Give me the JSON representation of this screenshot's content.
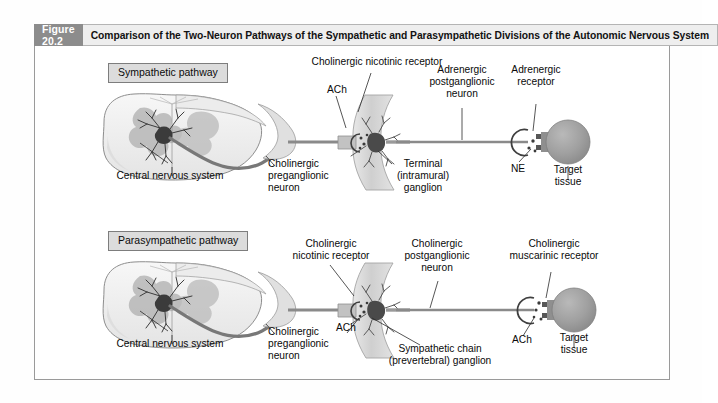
{
  "figure": {
    "number": "Figure 20.2",
    "title": "Comparison of the Two-Neuron Pathways of the Sympathetic and Parasympathetic Divisions of the Autonomic Nervous System"
  },
  "colors": {
    "header_number_bg": "#8c8c8c",
    "header_title_bg": "#eeeeee",
    "frame_border": "#9a9a9a",
    "panel_label_bg": "#dcdcdc",
    "panel_label_border": "#7d7d7d",
    "target_tissue_fill": "#9e9e9e",
    "ganglion_fill": "#d5d5d5",
    "axon_stroke": "#7a7a7a",
    "preganglionic_fiber": "#8f8f8f",
    "cord_fill": "#f2f2f2",
    "gray_matter": "#c6c6c6",
    "text": "#0a0a0a"
  },
  "sympathetic": {
    "panel_label": "Sympathetic pathway",
    "labels": {
      "cns": "Central nervous system",
      "preganglionic": "Cholinergic\npreganglionic\nneuron",
      "preganglionic_line1": "Cholinergic",
      "preganglionic_line2": "preganglionic",
      "preganglionic_line3": "neuron",
      "nicotinic_receptor": "Cholinergic nicotinic receptor",
      "ach": "ACh",
      "ganglion_line1": "Terminal",
      "ganglion_line2": "(intramural)",
      "ganglion_line3": "ganglion",
      "postganglionic_line1": "Adrenergic",
      "postganglionic_line2": "postganglionic",
      "postganglionic_line3": "neuron",
      "receptor_line1": "Adrenergic",
      "receptor_line2": "receptor",
      "transmitter": "NE",
      "target_line1": "Target",
      "target_line2": "tissue"
    }
  },
  "parasympathetic": {
    "panel_label": "Parasympathetic pathway",
    "labels": {
      "cns": "Central nervous system",
      "preganglionic_line1": "Cholinergic",
      "preganglionic_line2": "preganglionic",
      "preganglionic_line3": "neuron",
      "nicotinic_line1": "Cholinergic",
      "nicotinic_line2": "nicotinic receptor",
      "ach_left": "ACh",
      "ganglion_line1": "Sympathetic chain",
      "ganglion_line2": "(prevertebral) ganglion",
      "postganglionic_line1": "Cholinergic",
      "postganglionic_line2": "postganglionic",
      "postganglionic_line3": "neuron",
      "receptor_line1": "Cholinergic",
      "receptor_line2": "muscarinic receptor",
      "ach_right": "ACh",
      "target_line1": "Target",
      "target_line2": "tissue"
    }
  }
}
